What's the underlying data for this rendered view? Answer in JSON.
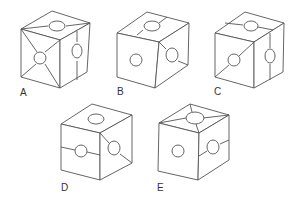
{
  "figure": {
    "type": "cube-folding-options",
    "options": [
      {
        "label": "A",
        "top": "hole with two diagonal lines to corners",
        "front": "hole with lines to all four corners",
        "right": "hole with vertical line"
      },
      {
        "label": "B",
        "top": "hole with line across (left-right)",
        "front": "plain hole",
        "right": "hole with diagonal line"
      },
      {
        "label": "C",
        "top": "hole with horizontal line",
        "front": "hole with diagonal line",
        "right": "hole with vertical line"
      },
      {
        "label": "D",
        "top": "plain hole",
        "front": "hole with horizontal line",
        "right": "hole with diagonal line"
      },
      {
        "label": "E",
        "top": "hole with lines to all four corners",
        "front": "plain hole",
        "right": "hole with horizontal line"
      }
    ]
  },
  "labels": {
    "a": "A",
    "b": "B",
    "c": "C",
    "d": "D",
    "e": "E"
  }
}
